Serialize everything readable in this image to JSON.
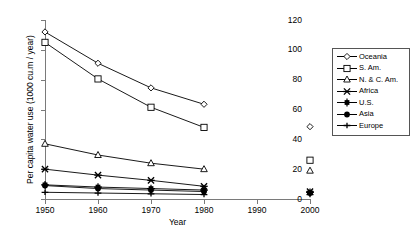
{
  "chart_data": {
    "type": "line",
    "title": "",
    "xlabel": "Year",
    "ylabel": "Per capita water use (1000 cu.m / year)",
    "xlim": [
      1950,
      2000
    ],
    "ylim": [
      0,
      120
    ],
    "ytick_labels": [
      "0",
      "20",
      "40",
      "60",
      "80",
      "100",
      "120"
    ],
    "ytick_values": [
      0,
      20,
      40,
      60,
      80,
      100,
      120
    ],
    "xtick_labels": [
      "1950",
      "1960",
      "1970",
      "1980",
      "1990",
      "2000"
    ],
    "xtick_values": [
      1950,
      1960,
      1970,
      1980,
      1990,
      2000
    ],
    "grid": false,
    "legend_position": "right",
    "x": [
      1950,
      1960,
      1970,
      1980,
      2000
    ],
    "series": [
      {
        "name": "Oceania",
        "marker": "open-diamond",
        "values": [
          112,
          91,
          74.5,
          63.5,
          48.5
        ]
      },
      {
        "name": "S. Am.",
        "marker": "open-square",
        "values": [
          105,
          80.5,
          61.5,
          48,
          26
        ]
      },
      {
        "name": "N. & C. Am.",
        "marker": "open-triangle",
        "values": [
          37,
          29.5,
          24,
          20,
          19
        ]
      },
      {
        "name": "Africa",
        "marker": "cross-x",
        "values": [
          20,
          16,
          12.5,
          8.5,
          5
        ]
      },
      {
        "name": "U.S.",
        "marker": "filled-star",
        "values": [
          9.5,
          8,
          7,
          6,
          4.5
        ]
      },
      {
        "name": "Asia",
        "marker": "filled-circle",
        "values": [
          9,
          7,
          6,
          5,
          4
        ]
      },
      {
        "name": "Europe",
        "marker": "plus",
        "values": [
          4.5,
          4,
          3.5,
          3,
          3
        ]
      }
    ]
  },
  "legend": {
    "entries": [
      {
        "label": "Oceania"
      },
      {
        "label": "S. Am."
      },
      {
        "label": "N. & C. Am."
      },
      {
        "label": "Africa"
      },
      {
        "label": "U.S."
      },
      {
        "label": "Asia"
      },
      {
        "label": "Europe"
      }
    ]
  },
  "colors": {
    "axis": "#7a7a7a",
    "series": "#000000",
    "legend_border": "#555555"
  }
}
